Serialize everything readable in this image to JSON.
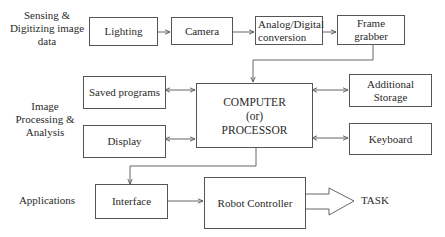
{
  "stages": {
    "sensing": "Sensing & Digitizing image data",
    "processing": "Image Processing & Analysis",
    "applications": "Applications"
  },
  "stage_lines": {
    "sensing": [
      "Sensing &",
      "Digitizing image",
      "data"
    ],
    "processing": [
      "Image",
      "Processing &",
      "Analysis"
    ],
    "applications": [
      "Applications"
    ]
  },
  "blocks": {
    "lighting": "Lighting",
    "camera": "Camera",
    "adc": [
      "Analog/Digital",
      "conversion"
    ],
    "frame_grabber": [
      "Frame",
      "grabber"
    ],
    "saved_programs": "Saved programs",
    "display": "Display",
    "computer": [
      "COMPUTER",
      "(or)",
      "PROCESSOR"
    ],
    "additional_storage": [
      "Additional",
      "Storage"
    ],
    "keyboard": "Keyboard",
    "interface": "Interface",
    "robot_controller": "Robot Controller"
  },
  "output": {
    "task": "TASK"
  },
  "colors": {
    "line": "#555555",
    "text": "#2a2a2a",
    "background": "#ffffff"
  }
}
